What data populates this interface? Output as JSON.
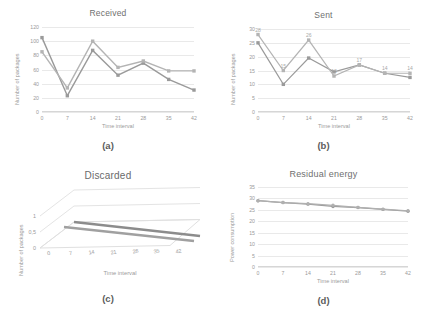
{
  "figure": {
    "panels": [
      {
        "caption": "(a)",
        "chart_data": {
          "type": "line",
          "title": "Received",
          "xlabel": "Time interval",
          "ylabel": "Number of packages",
          "x": [
            0,
            7,
            14,
            21,
            28,
            35,
            42
          ],
          "xticks": [
            "0",
            "7",
            "14",
            "21",
            "28",
            "35",
            "42"
          ],
          "yticks": [
            "0",
            "20",
            "40",
            "60",
            "80",
            "100",
            "120"
          ],
          "ylim": [
            0,
            120
          ],
          "grid": true,
          "legend": "none",
          "series": [
            {
              "name": "series-1",
              "color": "#9a9a9a",
              "values": [
                105,
                23,
                87,
                52,
                69,
                46,
                31
              ]
            },
            {
              "name": "series-2",
              "color": "#b4b4b4",
              "values": [
                85,
                34,
                100,
                63,
                72,
                58,
                58
              ]
            }
          ]
        }
      },
      {
        "caption": "(b)",
        "chart_data": {
          "type": "line",
          "title": "Sent",
          "xlabel": "Time interval",
          "ylabel": "Number of packages",
          "x": [
            0,
            7,
            14,
            21,
            28,
            35,
            42
          ],
          "xticks": [
            "0",
            "7",
            "14",
            "21",
            "28",
            "35",
            "42"
          ],
          "yticks": [
            "0",
            "5",
            "10",
            "15",
            "20",
            "25",
            "30"
          ],
          "ylim": [
            0,
            30
          ],
          "grid": true,
          "legend": "none",
          "data_labels": [
            "28",
            "15",
            "26",
            "13",
            "17",
            "14",
            "14"
          ],
          "series": [
            {
              "name": "series-1",
              "color": "#9a9a9a",
              "values": [
                25,
                10,
                19.5,
                14.5,
                17,
                14,
                12.5
              ]
            },
            {
              "name": "series-2",
              "color": "#b4b4b4",
              "values": [
                28,
                15,
                26,
                13,
                17,
                14,
                14
              ]
            }
          ]
        }
      },
      {
        "caption": "(c)",
        "chart_data": {
          "type": "line",
          "title": "Discarded",
          "xlabel": "Time interval",
          "ylabel": "Number of packages",
          "x": [
            0,
            7,
            14,
            21,
            28,
            35,
            42
          ],
          "xticks": [
            "0",
            "7",
            "14",
            "21",
            "28",
            "35",
            "42"
          ],
          "yticks": [
            "0",
            "0,5",
            "1"
          ],
          "ylim": [
            0,
            1
          ],
          "grid": true,
          "legend": "none",
          "projection": "3d",
          "series": [
            {
              "name": "series-1",
              "color": "#8c8c8c",
              "values": [
                0,
                0,
                0,
                0,
                0,
                0,
                0
              ]
            },
            {
              "name": "series-2",
              "color": "#a0a0a0",
              "values": [
                0,
                0,
                0,
                0,
                0,
                0,
                0
              ]
            }
          ]
        }
      },
      {
        "caption": "(d)",
        "chart_data": {
          "type": "line",
          "title": "Residual energy",
          "xlabel": "Time interval",
          "ylabel": "Power consumption",
          "x": [
            0,
            7,
            14,
            21,
            28,
            35,
            42
          ],
          "xticks": [
            "0",
            "7",
            "14",
            "21",
            "28",
            "35",
            "42"
          ],
          "yticks": [
            "0",
            "5",
            "10",
            "15",
            "20",
            "25",
            "30",
            "35"
          ],
          "ylim": [
            0,
            35
          ],
          "grid": true,
          "legend": "none",
          "series": [
            {
              "name": "series-1",
              "color": "#9a9a9a",
              "values": [
                29,
                28.2,
                27.5,
                26.5,
                26,
                25.2,
                24.4
              ]
            },
            {
              "name": "series-2",
              "color": "#b0b0b0",
              "values": [
                29,
                28.2,
                27.7,
                27,
                26.1,
                25.3,
                24.6
              ]
            }
          ]
        }
      }
    ]
  }
}
